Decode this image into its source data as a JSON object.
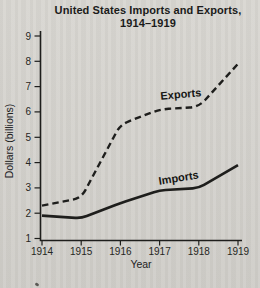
{
  "page": {
    "paper_color": "#d6d4cf",
    "ink_color": "#1e1e1c"
  },
  "chart_data": {
    "type": "line",
    "title_line1": "United States Imports and Exports,",
    "title_line2": "1914–1919",
    "xlabel": "Year",
    "ylabel": "Dollars (billions)",
    "x": [
      1914,
      1915,
      1916,
      1917,
      1918,
      1919
    ],
    "xticks": [
      1914,
      1915,
      1916,
      1917,
      1918,
      1919
    ],
    "yticks": [
      1,
      2,
      3,
      4,
      5,
      6,
      7,
      8,
      9
    ],
    "xlim": [
      1914,
      1919
    ],
    "ylim": [
      1,
      9
    ],
    "grid": false,
    "legend": "inline-labels",
    "series": [
      {
        "name": "Exports",
        "line_style": "dashed",
        "color": "#1e1e1c",
        "values": [
          2.3,
          2.6,
          5.5,
          6.1,
          6.2,
          7.9
        ],
        "label": {
          "x": 1917.55,
          "y": 6.55,
          "rotation": -5
        }
      },
      {
        "name": "Imports",
        "line_style": "solid",
        "color": "#1e1e1c",
        "values": [
          1.9,
          1.8,
          2.4,
          2.9,
          3.0,
          3.9
        ],
        "label": {
          "x": 1917.5,
          "y": 3.25,
          "rotation": -9
        }
      }
    ]
  }
}
